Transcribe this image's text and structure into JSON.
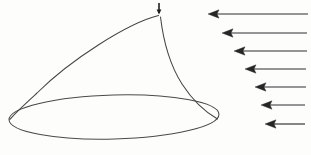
{
  "figure": {
    "background_color": "#fdfdfc",
    "line_color": "#3b3b3b",
    "arrow_color": "#262626",
    "width": 311,
    "height": 155
  },
  "cone": {
    "name": "cone-shape",
    "apex": {
      "x": 159,
      "y": 15
    },
    "base_ellipse": {
      "center_x": 114,
      "center_y": 117,
      "radius_x": 105,
      "radius_y": 22,
      "rotation_deg": -1.5
    },
    "left_edge": {
      "label": "left-slant-curve",
      "from_x": 159,
      "from_y": 15,
      "to_x": 10,
      "to_y": 120,
      "control_x": 70,
      "control_y": 40
    },
    "right_edge": {
      "label": "right-slant-curve",
      "from_x": 161,
      "from_y": 17,
      "to_x": 216,
      "to_y": 118,
      "control_x": 168,
      "control_y": 80
    },
    "apex_marker": {
      "label": "apex-tick-mark",
      "x": 159,
      "y_top": 3,
      "y_bottom": 14
    }
  },
  "arrows": {
    "name": "flow-arrow-group",
    "count": 7,
    "direction": "leftward",
    "tail_x": 308,
    "items": [
      {
        "index": 1,
        "head_x": 208,
        "y": 14,
        "tail_x": 308
      },
      {
        "index": 2,
        "head_x": 222,
        "y": 33,
        "tail_x": 307
      },
      {
        "index": 3,
        "head_x": 234,
        "y": 51,
        "tail_x": 307
      },
      {
        "index": 4,
        "head_x": 245,
        "y": 69,
        "tail_x": 306
      },
      {
        "index": 5,
        "head_x": 255,
        "y": 87,
        "tail_x": 306
      },
      {
        "index": 6,
        "head_x": 261,
        "y": 105,
        "tail_x": 305
      },
      {
        "index": 7,
        "head_x": 265,
        "y": 124,
        "tail_x": 305
      }
    ]
  }
}
